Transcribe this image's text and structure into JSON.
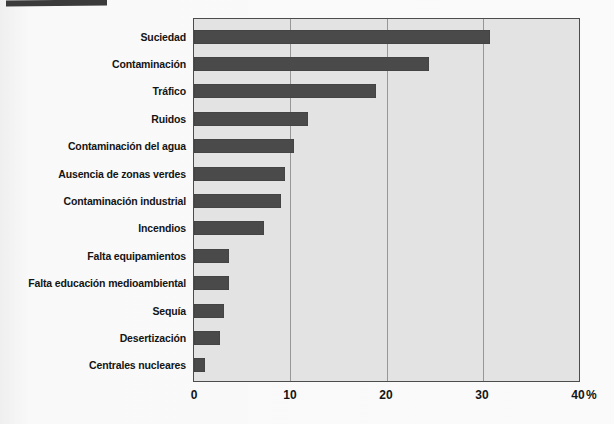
{
  "chart_data": {
    "type": "bar",
    "orientation": "horizontal",
    "title": "",
    "xlabel": "%",
    "ylabel": "",
    "categories": [
      "Suciedad",
      "Contaminación",
      "Tráfico",
      "Ruidos",
      "Contaminación del agua",
      "Ausencia de zonas verdes",
      "Contaminación industrial",
      "Incendios",
      "Falta equipamientos",
      "Falta educación medioambiental",
      "Sequía",
      "Desertización",
      "Centrales nucleares"
    ],
    "values": [
      30.8,
      24.5,
      19.0,
      11.9,
      10.4,
      9.5,
      9.1,
      7.3,
      3.6,
      3.6,
      3.1,
      2.7,
      1.1
    ],
    "xlim": [
      0,
      40
    ],
    "x_ticks": [
      "0",
      "10",
      "20",
      "30",
      "40"
    ],
    "unit_label": "%",
    "grid": true,
    "gridline_values": [
      10,
      20,
      30
    ],
    "legend": false,
    "colors": {
      "bar": "#4a4a4a",
      "plot_background": "#e3e3e3",
      "gridline": "#979797",
      "frame": "#4c4c4c",
      "page_background": "#fafafa",
      "corner_decoration": "#3b3b3b",
      "text": "#141414"
    }
  }
}
